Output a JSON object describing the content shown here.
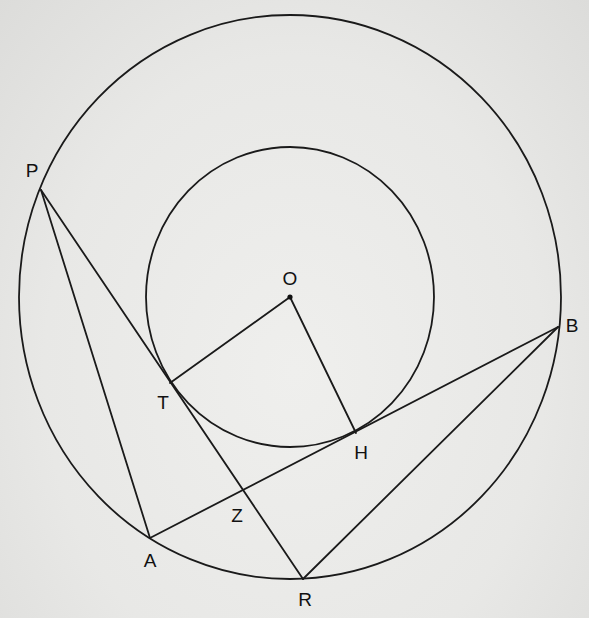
{
  "diagram": {
    "type": "geometry",
    "circles": [
      {
        "name": "outer",
        "center": "O",
        "cx": 290,
        "cy": 297,
        "rx": 271,
        "ry": 282
      },
      {
        "name": "inner",
        "center": "O",
        "cx": 290,
        "cy": 297,
        "rx": 144,
        "ry": 150
      }
    ],
    "points": [
      {
        "id": "O",
        "label": "O",
        "x": 290,
        "y": 297,
        "lx": 290,
        "ly": 280
      },
      {
        "id": "P",
        "label": "P",
        "x": 41,
        "y": 190,
        "lx": 32,
        "ly": 172
      },
      {
        "id": "T",
        "label": "T",
        "x": 170,
        "y": 383,
        "lx": 163,
        "ly": 404
      },
      {
        "id": "H",
        "label": "H",
        "x": 356,
        "y": 433,
        "lx": 361,
        "ly": 454
      },
      {
        "id": "B",
        "label": "B",
        "x": 558,
        "y": 327,
        "lx": 572,
        "ly": 327
      },
      {
        "id": "Z",
        "label": "Z",
        "x": 244,
        "y": 490,
        "lx": 237,
        "ly": 517
      },
      {
        "id": "A",
        "label": "A",
        "x": 150,
        "y": 538,
        "lx": 150,
        "ly": 562
      },
      {
        "id": "R",
        "label": "R",
        "x": 303,
        "y": 579,
        "lx": 305,
        "ly": 601
      }
    ],
    "segments": [
      {
        "from": "P",
        "to": "A"
      },
      {
        "from": "P",
        "to": "R"
      },
      {
        "from": "O",
        "to": "T"
      },
      {
        "from": "O",
        "to": "H"
      },
      {
        "from": "A",
        "to": "B"
      },
      {
        "from": "B",
        "to": "R"
      }
    ],
    "stroke_color": "#1a1a1a",
    "background_color": "#e9e9e7"
  }
}
